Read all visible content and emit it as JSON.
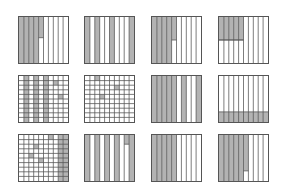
{
  "diagram": {
    "colors": {
      "shade": "#b3b3b3",
      "line": "#555555",
      "background": "#ffffff"
    },
    "grids": [
      {
        "id": "g1",
        "x": 18,
        "y": 16,
        "cols": 10,
        "rows": 1,
        "full_cols": [
          1,
          2,
          3,
          4
        ],
        "partial": [
          {
            "col": 5,
            "from": 0,
            "to": 0.45
          }
        ],
        "cells": []
      },
      {
        "id": "g2",
        "x": 84,
        "y": 16,
        "cols": 10,
        "rows": 1,
        "full_cols": [
          1,
          3,
          6,
          10
        ],
        "partial": [],
        "cells": []
      },
      {
        "id": "g3",
        "x": 151,
        "y": 16,
        "cols": 10,
        "rows": 1,
        "full_cols": [
          1,
          2,
          3,
          4
        ],
        "partial": [
          {
            "col": 5,
            "from": 0,
            "to": 0.5
          }
        ],
        "cells": []
      },
      {
        "id": "g4",
        "x": 218,
        "y": 16,
        "cols": 10,
        "rows": 1,
        "full_cols": [],
        "partial": [
          {
            "col": 1,
            "from": 0,
            "to": 0.5
          },
          {
            "col": 2,
            "from": 0,
            "to": 0.5
          },
          {
            "col": 3,
            "from": 0,
            "to": 0.5
          },
          {
            "col": 4,
            "from": 0,
            "to": 0.5
          },
          {
            "col": 5,
            "from": 0,
            "to": 0.5
          }
        ],
        "hline": {
          "y": 0.5,
          "from_col": 1,
          "to_col": 5
        },
        "cells": []
      },
      {
        "id": "g5",
        "x": 18,
        "y": 75,
        "cols": 10,
        "rows": 10,
        "full_cols": [
          2,
          4,
          6
        ],
        "partial": [],
        "cells": [
          [
            2,
            8
          ],
          [
            5,
            9
          ]
        ]
      },
      {
        "id": "g6",
        "x": 84,
        "y": 75,
        "cols": 10,
        "rows": 10,
        "full_cols": [],
        "partial": [],
        "cells": [
          [
            1,
            3
          ],
          [
            3,
            7
          ],
          [
            5,
            4
          ]
        ]
      },
      {
        "id": "g7",
        "x": 151,
        "y": 75,
        "cols": 10,
        "rows": 1,
        "full_cols": [
          1,
          2,
          3,
          4,
          5,
          7,
          10
        ],
        "partial": [],
        "cells": []
      },
      {
        "id": "g8",
        "x": 218,
        "y": 75,
        "cols": 10,
        "rows": 1,
        "full_cols": [],
        "partial": [],
        "bottom_band": 0.22,
        "cells": []
      },
      {
        "id": "g9",
        "x": 18,
        "y": 134,
        "cols": 10,
        "rows": 10,
        "full_cols": [
          9,
          10
        ],
        "partial": [],
        "cells": [
          [
            1,
            7
          ],
          [
            3,
            4
          ],
          [
            5,
            3
          ],
          [
            6,
            5
          ]
        ]
      },
      {
        "id": "g10",
        "x": 84,
        "y": 134,
        "cols": 10,
        "rows": 1,
        "full_cols": [
          1,
          3,
          5,
          7,
          10
        ],
        "partial": [
          {
            "col": 9,
            "from": 0,
            "to": 0.2
          }
        ],
        "hline_partial": {
          "col": 9,
          "y": 0.2
        },
        "cells": []
      },
      {
        "id": "g11",
        "x": 151,
        "y": 134,
        "cols": 10,
        "rows": 1,
        "full_cols": [
          1,
          2,
          3,
          4,
          5
        ],
        "partial": [],
        "cells": []
      },
      {
        "id": "g12",
        "x": 218,
        "y": 134,
        "cols": 10,
        "rows": 1,
        "full_cols": [
          1,
          2,
          3,
          4,
          5
        ],
        "partial": [
          {
            "col": 6,
            "from": 0,
            "to": 0.78
          }
        ],
        "cells": []
      }
    ]
  }
}
